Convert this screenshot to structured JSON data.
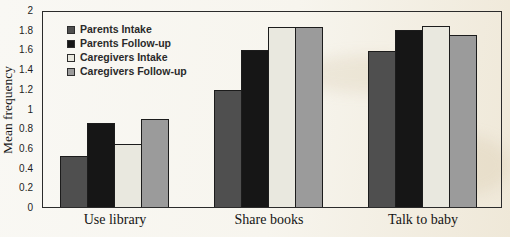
{
  "chart_data": {
    "type": "bar",
    "title": "",
    "xlabel": "",
    "ylabel": "Mean frequency",
    "categories": [
      "Use library",
      "Share books",
      "Talk to baby"
    ],
    "series": [
      {
        "name": "Parents Intake",
        "color": "#4f4f4f",
        "values": [
          0.52,
          1.2,
          1.6
        ]
      },
      {
        "name": "Parents Follow-up",
        "color": "#161616",
        "values": [
          0.86,
          1.61,
          1.82
        ]
      },
      {
        "name": "Caregivers Intake",
        "color": "#e9e8df",
        "values": [
          0.65,
          1.85,
          1.86
        ]
      },
      {
        "name": "Caregivers Follow-up",
        "color": "#9b9b9b",
        "values": [
          0.9,
          1.85,
          1.76
        ]
      }
    ],
    "ylim": [
      0,
      2
    ],
    "ytick_labels": [
      "0",
      "0.2",
      "0.4",
      "0.6",
      "0.8",
      "1",
      "1.2",
      "1.4",
      "1.6",
      "1.8",
      "2"
    ],
    "grid": false,
    "legend_position": "upper-left-inside",
    "colors": {
      "frame": "#2b2b2b",
      "bar_border": "#1c1c1c",
      "paper_background": "#f4f0e5"
    }
  }
}
